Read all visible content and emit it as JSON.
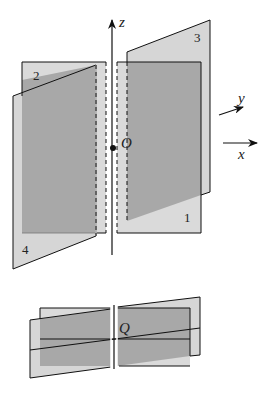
{
  "figure": {
    "top_view": {
      "axes": {
        "z_label": "z",
        "y_label": "y",
        "x_label": "x"
      },
      "origin_label": "O",
      "plane_labels": [
        "1",
        "2",
        "3",
        "4"
      ]
    },
    "bottom_view": {
      "point_label": "Q"
    },
    "colors": {
      "plane_light": "#d9d9d9",
      "plane_overlap": "#a6a6a6",
      "line": "#111111"
    }
  }
}
